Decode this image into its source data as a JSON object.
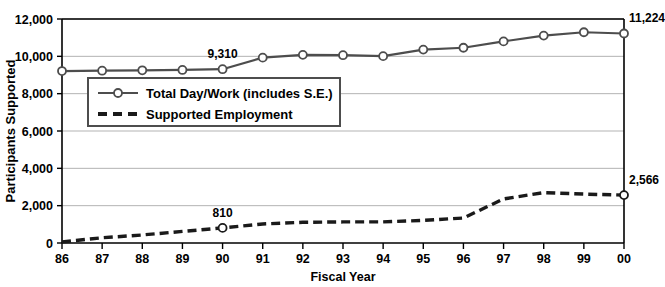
{
  "chart_data": {
    "type": "line",
    "title": "",
    "xlabel": "Fiscal Year",
    "ylabel": "Participants Supported",
    "categories": [
      "86",
      "87",
      "88",
      "89",
      "90",
      "91",
      "92",
      "93",
      "94",
      "95",
      "96",
      "97",
      "98",
      "99",
      "00"
    ],
    "xlim": [
      0,
      14
    ],
    "ylim": [
      0,
      12000
    ],
    "yticks": [
      "0",
      "2,000",
      "4,000",
      "6,000",
      "8,000",
      "10,000",
      "12,000"
    ],
    "ytick_values": [
      0,
      2000,
      4000,
      6000,
      8000,
      10000,
      12000
    ],
    "grid": "horizontal",
    "legend_position": "upper-left-inset",
    "series": [
      {
        "name": "Total Day/Work (includes S.E.)",
        "style": "solid",
        "marker": "open-circle",
        "color": "#4d4d4d",
        "values": [
          9210,
          9230,
          9250,
          9270,
          9310,
          9930,
          10080,
          10060,
          10010,
          10360,
          10460,
          10800,
          11110,
          11290,
          11224
        ]
      },
      {
        "name": "Supported Employment",
        "style": "dashed",
        "marker": "none",
        "color": "#1a1a1a",
        "values": [
          60,
          280,
          430,
          620,
          810,
          1020,
          1110,
          1130,
          1130,
          1210,
          1340,
          2360,
          2700,
          2620,
          2566
        ]
      }
    ],
    "annotations": [
      {
        "text": "9,310",
        "series": "Total Day/Work (includes S.E.)",
        "category": "90",
        "value": 9310
      },
      {
        "text": "11,224",
        "series": "Total Day/Work (includes S.E.)",
        "category": "00",
        "value": 11224
      },
      {
        "text": "810",
        "series": "Supported Employment",
        "category": "90",
        "value": 810
      },
      {
        "text": "2,566",
        "series": "Supported Employment",
        "category": "00",
        "value": 2566
      }
    ],
    "highlight_markers": [
      {
        "series": "Supported Employment",
        "category": "90",
        "value": 810
      },
      {
        "series": "Supported Employment",
        "category": "00",
        "value": 2566
      }
    ]
  },
  "legend": {
    "items": [
      {
        "label": "Total Day/Work (includes S.E.)"
      },
      {
        "label": "Supported Employment"
      }
    ]
  },
  "colors": {
    "series_total": "#4d4d4d",
    "series_se": "#1a1a1a",
    "grid": "#b3b3b3",
    "axis": "#000000",
    "background": "#ffffff"
  }
}
